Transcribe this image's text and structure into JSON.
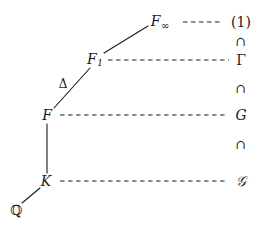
{
  "diagram": {
    "background_color": "#ffffff",
    "line_color": "#1a1a1a",
    "fields": [
      {
        "key": "F_infinity",
        "label": "F",
        "sub": "∞",
        "x": 160,
        "y": 22
      },
      {
        "key": "F_1",
        "label": "F",
        "sub": "1",
        "x": 95,
        "y": 60
      },
      {
        "key": "F",
        "label": "F",
        "sub": "",
        "x": 47,
        "y": 115
      },
      {
        "key": "K",
        "label": "K",
        "sub": "",
        "x": 46,
        "y": 181
      },
      {
        "key": "Q",
        "label": "ℚ",
        "sub": "",
        "x": 16,
        "y": 210
      }
    ],
    "groups": [
      {
        "key": "one",
        "label": "(1)",
        "x": 241,
        "y": 22,
        "style": "upright"
      },
      {
        "key": "Gamma",
        "label": "Γ",
        "x": 241,
        "y": 60,
        "style": "upright"
      },
      {
        "key": "G",
        "label": "G",
        "x": 241,
        "y": 115,
        "style": "italic"
      },
      {
        "key": "scriptG",
        "label": "𝒢",
        "x": 241,
        "y": 181,
        "style": "script"
      }
    ],
    "inclusions": [
      {
        "key": "cap-1",
        "symbol": "∩",
        "x": 241,
        "y": 41
      },
      {
        "key": "cap-2",
        "symbol": "∩",
        "x": 241,
        "y": 88
      },
      {
        "key": "cap-3",
        "symbol": "∩",
        "x": 241,
        "y": 144
      }
    ],
    "edge_labels": [
      {
        "key": "delta",
        "label": "Δ",
        "x": 63,
        "y": 84
      }
    ],
    "solid_edges": [
      {
        "key": "edge-F1-Finf",
        "x1": 104,
        "y1": 53,
        "x2": 148,
        "y2": 26
      },
      {
        "key": "edge-F-F1",
        "x1": 54,
        "y1": 108,
        "x2": 90,
        "y2": 68
      },
      {
        "key": "edge-F-K",
        "x1": 47,
        "y1": 124,
        "x2": 47,
        "y2": 173
      },
      {
        "key": "edge-Q-K",
        "x1": 22,
        "y1": 203,
        "x2": 40,
        "y2": 188
      }
    ],
    "dashed_edges": [
      {
        "key": "dash-Finf-one",
        "x1": 183,
        "y1": 22,
        "x2": 223,
        "y2": 22
      },
      {
        "key": "dash-F1-Gamma",
        "x1": 108,
        "y1": 60,
        "x2": 229,
        "y2": 60
      },
      {
        "key": "dash-F-G",
        "x1": 60,
        "y1": 115,
        "x2": 228,
        "y2": 115
      },
      {
        "key": "dash-K-scriptG",
        "x1": 60,
        "y1": 181,
        "x2": 227,
        "y2": 181
      }
    ]
  }
}
